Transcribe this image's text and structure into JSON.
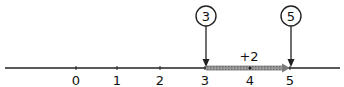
{
  "diagram": {
    "type": "number-line-addition",
    "tick_labels": [
      "0",
      "1",
      "2",
      "3",
      "4",
      "5"
    ],
    "start_marker": "3",
    "end_marker": "5",
    "jump_label": "+2",
    "colors": {
      "line": "#222222",
      "jump_arrow": "#8a8a8a"
    }
  }
}
